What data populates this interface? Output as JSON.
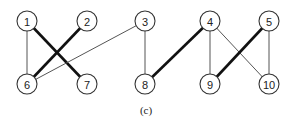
{
  "diagram": {
    "type": "bipartite-matching-graph",
    "caption": "(c)",
    "nodes": [
      {
        "id": "1",
        "label": "1",
        "x": 27,
        "y": 21,
        "row": "top"
      },
      {
        "id": "2",
        "label": "2",
        "x": 87,
        "y": 21,
        "row": "top"
      },
      {
        "id": "3",
        "label": "3",
        "x": 145,
        "y": 21,
        "row": "top"
      },
      {
        "id": "4",
        "label": "4",
        "x": 210,
        "y": 21,
        "row": "top"
      },
      {
        "id": "5",
        "label": "5",
        "x": 269,
        "y": 21,
        "row": "top"
      },
      {
        "id": "6",
        "label": "6",
        "x": 27,
        "y": 84,
        "row": "bottom"
      },
      {
        "id": "7",
        "label": "7",
        "x": 87,
        "y": 84,
        "row": "bottom"
      },
      {
        "id": "8",
        "label": "8",
        "x": 145,
        "y": 84,
        "row": "bottom"
      },
      {
        "id": "9",
        "label": "9",
        "x": 210,
        "y": 84,
        "row": "bottom"
      },
      {
        "id": "10",
        "label": "10",
        "x": 269,
        "y": 84,
        "row": "bottom"
      }
    ],
    "edges": [
      {
        "from": "1",
        "to": "6",
        "style": "thin"
      },
      {
        "from": "1",
        "to": "7",
        "style": "thick"
      },
      {
        "from": "2",
        "to": "6",
        "style": "thick"
      },
      {
        "from": "3",
        "to": "6",
        "style": "thin"
      },
      {
        "from": "3",
        "to": "8",
        "style": "thin"
      },
      {
        "from": "4",
        "to": "8",
        "style": "thick"
      },
      {
        "from": "4",
        "to": "9",
        "style": "thin"
      },
      {
        "from": "4",
        "to": "10",
        "style": "thin"
      },
      {
        "from": "5",
        "to": "9",
        "style": "thick"
      },
      {
        "from": "5",
        "to": "10",
        "style": "thin"
      }
    ],
    "node_radius": 10
  }
}
